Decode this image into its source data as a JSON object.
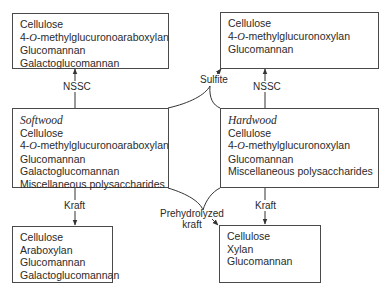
{
  "diagram": {
    "boxes": {
      "softwood_nssc": {
        "lines": [
          "Cellulose",
          "4-O-methylglucuronoarabinoxylan",
          "Glucomannan",
          "Galactoglucomannan"
        ]
      },
      "hardwood_sulfite_nssc": {
        "lines": [
          "Cellulose",
          "4-O-methylglucuronoxylan",
          "Glucomannan"
        ]
      },
      "softwood": {
        "title": "Softwood",
        "lines": [
          "Cellulose",
          "4-O-methylglucuronoarabinoxylan",
          "Glucomannan",
          "Galactoglucomannan",
          "Miscellaneous polysaccharides"
        ]
      },
      "hardwood": {
        "title": "Hardwood",
        "lines": [
          "Cellulose",
          "4-O-methylglucuronoxylan",
          "Glucomannan",
          "Miscellaneous polysaccharides"
        ]
      },
      "softwood_kraft": {
        "lines": [
          "Cellulose",
          "Araboxylan",
          "Glucomannan",
          "Galactoglucomannan"
        ]
      },
      "prehydrolyzed_kraft": {
        "lines": [
          "Cellulose",
          "Xylan",
          "Glucomannan"
        ]
      }
    },
    "edges": {
      "softwood_to_nssc": "NSSC",
      "hardwood_to_nssc": "NSSC",
      "sulfite": "Sulfite",
      "softwood_to_kraft": "Kraft",
      "hardwood_to_kraft": "Kraft",
      "prehydrolyzed_kraft_line1": "Prehydrolyzed",
      "prehydrolyzed_kraft_line2": "kraft"
    },
    "methyl_prefix": "4-",
    "methyl_o": "O",
    "softwood_methyl_suffix": "-methylglucuronoaraboxylan",
    "hardwood_methyl_suffix": "-methylglucuronoxylan"
  }
}
